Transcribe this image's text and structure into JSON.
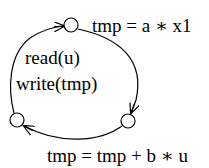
{
  "diagram": {
    "type": "state-cycle",
    "nodes": [
      {
        "id": "top",
        "label": "tmp = a ∗ x1"
      },
      {
        "id": "bottom-right",
        "label": ""
      },
      {
        "id": "bottom-left",
        "label": ""
      }
    ],
    "edges": [
      {
        "from": "top",
        "to": "bottom-right",
        "label": ""
      },
      {
        "from": "bottom-right",
        "to": "bottom-left",
        "label": ""
      },
      {
        "from": "bottom-left",
        "to": "top",
        "label": "read(u) write(tmp)"
      }
    ],
    "labels": {
      "top_action": "tmp = a ∗ x1",
      "bottom_action": "tmp = tmp + b ∗ u",
      "left_line1": "read(u)",
      "left_line2": "write(tmp)"
    }
  }
}
